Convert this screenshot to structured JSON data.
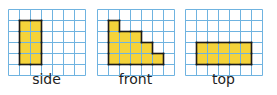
{
  "figure": {
    "grid": {
      "cols": 7,
      "rows": 6,
      "cell_px": 11,
      "line_color": "#6fb3e0",
      "fill_color": "#f5d33a",
      "outline_color": "#1a1a1a"
    },
    "views": [
      {
        "id": "side",
        "label": "side",
        "x": 8,
        "cells": [
          [
            1,
            1
          ],
          [
            2,
            1
          ],
          [
            1,
            2
          ],
          [
            2,
            2
          ],
          [
            1,
            3
          ],
          [
            2,
            3
          ],
          [
            1,
            4
          ],
          [
            2,
            4
          ]
        ]
      },
      {
        "id": "front",
        "label": "front",
        "x": 97,
        "cells": [
          [
            1,
            1
          ],
          [
            1,
            2
          ],
          [
            2,
            2
          ],
          [
            3,
            2
          ],
          [
            1,
            3
          ],
          [
            2,
            3
          ],
          [
            3,
            3
          ],
          [
            4,
            3
          ],
          [
            1,
            4
          ],
          [
            2,
            4
          ],
          [
            3,
            4
          ],
          [
            4,
            4
          ],
          [
            5,
            4
          ]
        ]
      },
      {
        "id": "top",
        "label": "top",
        "x": 185,
        "cells": [
          [
            1,
            3
          ],
          [
            2,
            3
          ],
          [
            3,
            3
          ],
          [
            4,
            3
          ],
          [
            5,
            3
          ],
          [
            1,
            4
          ],
          [
            2,
            4
          ],
          [
            3,
            4
          ],
          [
            4,
            4
          ],
          [
            5,
            4
          ]
        ]
      }
    ]
  }
}
